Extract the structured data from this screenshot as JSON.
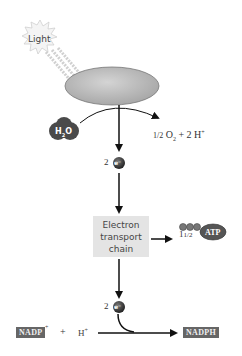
{
  "diagram": {
    "light": {
      "label": "Light",
      "icon": "sunburst-icon"
    },
    "photosystem": {
      "shape": "ellipse",
      "color": "#bdbdbd"
    },
    "water": {
      "label": "H2O",
      "label_main": "H",
      "label_sub": "2",
      "label_tail": "O"
    },
    "oxygen_products": {
      "label": "½ O₂ + 2 H⁺",
      "frac": "1/2",
      "o": "O",
      "o_sub": "2",
      "plus": "+",
      "h": "2 H",
      "h_sup": "+"
    },
    "electrons_top": {
      "count": "2",
      "symbol": "e⁻"
    },
    "etc": {
      "line1": "Electron",
      "line2": "transport",
      "line3": "chain",
      "color": "#e4e4e4"
    },
    "atp": {
      "yield": "1½",
      "yield_whole": "1",
      "yield_frac": "1/2",
      "label": "ATP",
      "color": "#555555"
    },
    "electrons_bottom": {
      "count": "2",
      "symbol": "e⁻"
    },
    "nadp": {
      "label": "NADP",
      "sup": "+",
      "plus": "+",
      "h": "H",
      "h_sup": "+",
      "color": "#666666"
    },
    "nadph": {
      "label": "NADPH",
      "color": "#666666"
    }
  }
}
